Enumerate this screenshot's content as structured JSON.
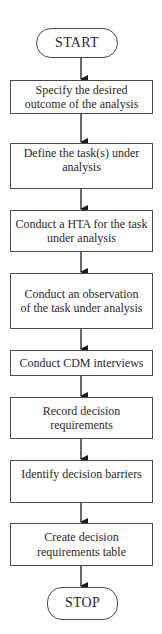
{
  "flowchart": {
    "start": {
      "label": "START"
    },
    "steps": [
      {
        "label": "Specify the desired outcome of the analysis"
      },
      {
        "label": "Define the task(s) under analysis"
      },
      {
        "label": "Conduct a HTA for the task under analysis"
      },
      {
        "label": "Conduct an observation of the task under analysis"
      },
      {
        "label": "Conduct CDM interviews"
      },
      {
        "label": "Record decision requirements"
      },
      {
        "label": "Identify decision barriers"
      },
      {
        "label": "Create decision requirements table"
      }
    ],
    "stop": {
      "label": "STOP"
    },
    "colors": {
      "stroke": "#4a4a4a",
      "text": "#2a2a2a",
      "background": "#ffffff"
    }
  }
}
